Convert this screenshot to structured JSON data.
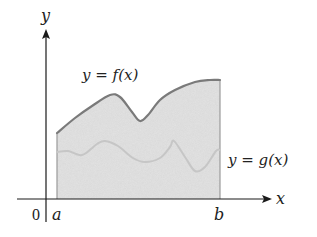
{
  "figure": {
    "type": "area-between-curves",
    "labels": {
      "y_axis": "y",
      "x_axis": "x",
      "origin": "0",
      "a": "a",
      "b": "b",
      "f_curve": "y = f(x)",
      "g_curve": "y = g(x)"
    },
    "colors": {
      "axis": "#1a1a1a",
      "fill": "#e4e4e4",
      "f_stroke": "#7a7a7a",
      "g_stroke": "#c6c6c6",
      "boundary": "#9a9a9a"
    },
    "f_points": [
      [
        57,
        133
      ],
      [
        75,
        118
      ],
      [
        92,
        106
      ],
      [
        110,
        95
      ],
      [
        120,
        97
      ],
      [
        132,
        112
      ],
      [
        140,
        121
      ],
      [
        148,
        115
      ],
      [
        160,
        100
      ],
      [
        175,
        90
      ],
      [
        195,
        82
      ],
      [
        210,
        80
      ],
      [
        220,
        80
      ]
    ],
    "g_points": [
      [
        57,
        152
      ],
      [
        68,
        151
      ],
      [
        82,
        155
      ],
      [
        97,
        144
      ],
      [
        105,
        141
      ],
      [
        118,
        146
      ],
      [
        133,
        158
      ],
      [
        145,
        162
      ],
      [
        160,
        158
      ],
      [
        170,
        147
      ],
      [
        174,
        141
      ],
      [
        185,
        157
      ],
      [
        195,
        171
      ],
      [
        205,
        167
      ],
      [
        216,
        151
      ],
      [
        220,
        150
      ]
    ]
  }
}
